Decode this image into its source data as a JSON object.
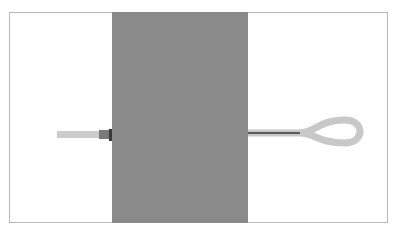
{
  "diagram": {
    "colors": {
      "frame_border": "#b8b8b8",
      "panel": "#8a8a8a",
      "cable_sheath": "#c8c8c8",
      "cable_core": "#5a5a5a",
      "connector": "#7a7a7a",
      "connector_edge": "#3a3a3a"
    }
  }
}
